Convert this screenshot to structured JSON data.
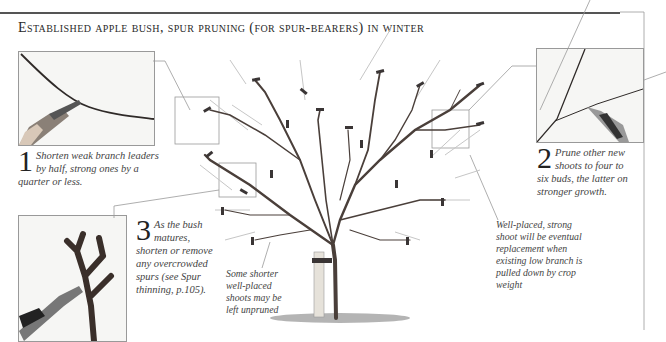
{
  "title": "Established apple bush, spur pruning (for spur-bearers) in winter",
  "steps": [
    {
      "number": "1",
      "text": "Shorten weak branch leaders by half, strong ones by a quarter or less."
    },
    {
      "number": "2",
      "text": "Prune other new shoots to four to six buds, the latter on stronger growth."
    },
    {
      "number": "3",
      "text": "As the bush matures, shorten or remove any overcrowded spurs (see Spur thinning, p.105)."
    }
  ],
  "annotations": {
    "unpruned": "Some shorter well-placed shoots may be left unpruned",
    "replacement": "Well-placed, strong shoot will be eventual replacement when existing low branch is pulled down by crop weight"
  },
  "colors": {
    "branch": "#4a3f3a",
    "cut": "#3a3535",
    "shoot": "#bdbdbd",
    "frame": "#9a9a9a"
  }
}
